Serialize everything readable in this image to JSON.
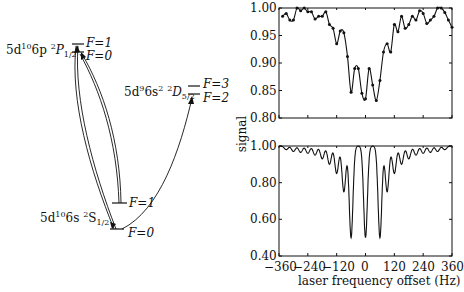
{
  "diagram": {
    "levels": {
      "p_state": {
        "config": "5d",
        "sup1": "10",
        "mid": "6p ",
        "sup2": "2",
        "term": "P",
        "sub": "1/2",
        "F_upper": "F=1",
        "F_lower": "F=0"
      },
      "d_state": {
        "config": "5d",
        "sup1": "9",
        "mid": "6s",
        "sup2": "2",
        "sup3": "2",
        "term": "D",
        "sub": "5/2",
        "F_upper": "F=3",
        "F_lower": "F=2"
      },
      "s_state": {
        "config": "5d",
        "sup1": "10",
        "mid": "6s ",
        "sup2": "2",
        "term": "S",
        "sub": "1/2",
        "F_upper": "F=1",
        "F_lower": "F=0"
      }
    }
  },
  "chart_data": [
    {
      "type": "line",
      "title": "",
      "xlabel": "",
      "ylabel": "signal",
      "xlim": [
        -360,
        360
      ],
      "ylim": [
        0.8,
        1.0
      ],
      "yticks": [
        "1.00",
        "0.95",
        "0.90",
        "0.85",
        "0.80"
      ],
      "markers": true,
      "x": [
        -345,
        -330,
        -315,
        -300,
        -285,
        -270,
        -255,
        -240,
        -225,
        -210,
        -195,
        -180,
        -165,
        -150,
        -135,
        -120,
        -105,
        -90,
        -75,
        -60,
        -45,
        -30,
        -15,
        0,
        15,
        30,
        45,
        60,
        75,
        90,
        105,
        120,
        135,
        150,
        165,
        180,
        195,
        210,
        225,
        240,
        255,
        270,
        285,
        300,
        315,
        330,
        345,
        360
      ],
      "values": [
        0.985,
        0.99,
        0.978,
        0.978,
        1.0,
        0.995,
        1.0,
        0.993,
        0.993,
        0.98,
        0.985,
        0.985,
        0.993,
        0.97,
        0.963,
        0.935,
        0.958,
        0.955,
        0.912,
        0.847,
        0.89,
        0.89,
        0.845,
        0.835,
        0.89,
        0.86,
        0.832,
        0.868,
        0.92,
        0.935,
        0.92,
        0.97,
        0.957,
        0.985,
        0.963,
        0.97,
        0.985,
        0.978,
        0.995,
        0.99,
        0.972,
        0.978,
        0.985,
        1.0,
        1.0,
        0.992,
        0.978,
        0.965
      ]
    },
    {
      "type": "line",
      "title": "",
      "xlabel": "laser frequency offset (Hz)",
      "ylabel": "signal",
      "xlim": [
        -360,
        360
      ],
      "ylim": [
        0.4,
        1.0
      ],
      "yticks": [
        "1.00",
        "0.80",
        "0.60",
        "0.40"
      ],
      "xticks": [
        "−360",
        "−240",
        "−120",
        "0",
        "120",
        "240",
        "360"
      ],
      "markers": false,
      "dip_centers": [
        -330,
        -300,
        -270,
        -240,
        -210,
        -180,
        -150,
        -120,
        -90,
        -60,
        0,
        60,
        90,
        120,
        150,
        180,
        210,
        240,
        270,
        300,
        330
      ],
      "dip_minima": [
        0.98,
        0.97,
        0.965,
        0.96,
        0.95,
        0.93,
        0.9,
        0.85,
        0.75,
        0.5,
        0.5,
        0.5,
        0.75,
        0.85,
        0.9,
        0.93,
        0.95,
        0.96,
        0.965,
        0.97,
        0.98
      ],
      "note": "central dips at -60, 0, +60 Hz reach 0.50"
    }
  ]
}
